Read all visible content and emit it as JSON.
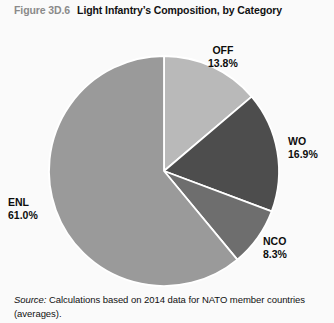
{
  "figure": {
    "number": "Figure 3D.6",
    "title": "Light Infantry’s Composition, by Category"
  },
  "source": {
    "label": "Source:",
    "text": " Calculations based on 2014 data for NATO member countries (averages)."
  },
  "colors": {
    "background": "#fafafa",
    "separator": "#ffffff",
    "off": "#b9b9b9",
    "wo": "#4d4d4d",
    "nco": "#6e6e6e",
    "enl": "#9a9a9a"
  },
  "labels": {
    "off": {
      "name": "OFF",
      "value": "13.8%"
    },
    "wo": {
      "name": "WO",
      "value": "16.9%"
    },
    "nco": {
      "name": "NCO",
      "value": "8.3%"
    },
    "enl": {
      "name": "ENL",
      "value": "61.0%"
    }
  },
  "chart_data": {
    "type": "pie",
    "title": "Light Infantry’s Composition, by Category",
    "categories": [
      "OFF",
      "WO",
      "NCO",
      "ENL"
    ],
    "values": [
      13.8,
      16.9,
      8.3,
      61.0
    ],
    "value_labels": [
      "13.8%",
      "16.9%",
      "8.3%",
      "61.0%"
    ],
    "unit": "percent",
    "total": 100.0,
    "start_angle_deg": 0,
    "direction": "clockwise",
    "slice_colors": [
      "#b9b9b9",
      "#4d4d4d",
      "#6e6e6e",
      "#9a9a9a"
    ],
    "legend": "none",
    "labels_position": "outside",
    "grid": false,
    "center_px": [
      164,
      171
    ],
    "radius_px": 115
  }
}
